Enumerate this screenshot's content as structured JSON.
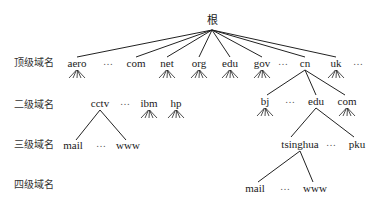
{
  "diagram": {
    "type": "tree",
    "root": {
      "label": "根",
      "x": 212,
      "y": 24
    },
    "level_labels": [
      {
        "id": "top",
        "label": "顶级域名",
        "y": 66
      },
      {
        "id": "second",
        "label": "二级域名",
        "y": 108
      },
      {
        "id": "third",
        "label": "三级域名",
        "y": 148
      },
      {
        "id": "fourth",
        "label": "四级域名",
        "y": 188
      }
    ],
    "top_level": [
      {
        "label": "aero",
        "x": 77,
        "fan": true,
        "edge": true
      },
      {
        "label": "…",
        "x": 108,
        "ellipsis": true
      },
      {
        "label": "com",
        "x": 136,
        "fan": false,
        "edge": true
      },
      {
        "label": "net",
        "x": 167,
        "fan": true,
        "edge": true
      },
      {
        "label": "org",
        "x": 199,
        "fan": true,
        "edge": true
      },
      {
        "label": "edu",
        "x": 230,
        "fan": true,
        "edge": true
      },
      {
        "label": "gov",
        "x": 262,
        "fan": true,
        "edge": true
      },
      {
        "label": "…",
        "x": 283,
        "ellipsis": true
      },
      {
        "label": "cn",
        "x": 305,
        "fan": false,
        "edge": true
      },
      {
        "label": "uk",
        "x": 336,
        "fan": true,
        "edge": true
      },
      {
        "label": "…",
        "x": 358,
        "ellipsis": true
      }
    ],
    "second_level": [
      {
        "label": "cctv",
        "x": 100,
        "parent": "com"
      },
      {
        "label": "…",
        "x": 125,
        "ellipsis": true
      },
      {
        "label": "ibm",
        "x": 149,
        "parent": "com",
        "fan": true
      },
      {
        "label": "hp",
        "x": 176,
        "parent": "com",
        "fan": true
      },
      {
        "label": "bj",
        "x": 265,
        "parent": "cn",
        "fan": true
      },
      {
        "label": "…",
        "x": 290,
        "ellipsis": true
      },
      {
        "label": "edu",
        "x": 316,
        "parent": "cn"
      },
      {
        "label": "com",
        "x": 347,
        "parent": "cn",
        "fan": true
      }
    ],
    "third_level": [
      {
        "label": "mail",
        "x": 73,
        "parent": "cctv"
      },
      {
        "label": "…",
        "x": 101,
        "ellipsis": true
      },
      {
        "label": "www",
        "x": 128,
        "parent": "cctv"
      },
      {
        "label": "tsinghua",
        "x": 300,
        "parent": "edu"
      },
      {
        "label": "…",
        "x": 331,
        "ellipsis": true
      },
      {
        "label": "pku",
        "x": 357,
        "parent": "edu"
      }
    ],
    "fourth_level": [
      {
        "label": "mail",
        "x": 255,
        "parent": "tsinghua"
      },
      {
        "label": "…",
        "x": 285,
        "ellipsis": true
      },
      {
        "label": "www",
        "x": 315,
        "parent": "tsinghua"
      }
    ]
  }
}
